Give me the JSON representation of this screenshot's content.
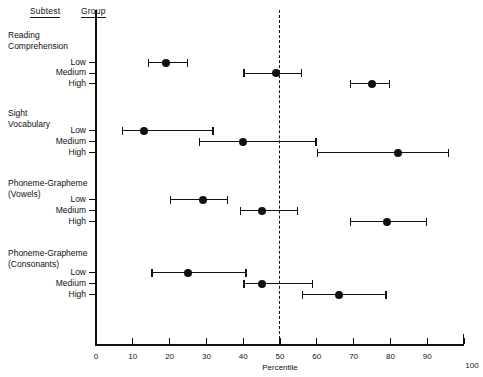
{
  "headers": {
    "subtest": "Subtest",
    "group": "Group"
  },
  "axis": {
    "xlabel": "Percentile",
    "ticks": [
      "0",
      "10",
      "20",
      "30",
      "40",
      "50",
      "60",
      "70",
      "80",
      "90",
      "100"
    ],
    "reference_value": 50
  },
  "chart_data": {
    "type": "scatter",
    "title": "",
    "subtitle": "",
    "xlabel": "Percentile",
    "ylabel": "",
    "xlim": [
      0,
      100
    ],
    "grid": false,
    "legend": "none",
    "reference_line": {
      "value": 50,
      "style": "dashed"
    },
    "annotations": [
      "Dashed vertical reference line at the 50th percentile"
    ],
    "tick_labels": [
      "0",
      "10",
      "20",
      "30",
      "40",
      "50",
      "60",
      "70",
      "80",
      "90",
      "100"
    ],
    "categories": [
      "Reading Comprehension - Low",
      "Reading Comprehension - Medium",
      "Reading Comprehension - High",
      "Sight Vocabulary - Low",
      "Sight Vocabulary - Medium",
      "Sight Vocabulary - High",
      "Phoneme-Grapheme (Vowels) - Low",
      "Phoneme-Grapheme (Vowels) - Medium",
      "Phoneme-Grapheme (Vowels) - High",
      "Phoneme-Grapheme (Consonants) - Low",
      "Phoneme-Grapheme (Consonants) - Medium",
      "Phoneme-Grapheme (Consonants) - High"
    ],
    "values": [
      19,
      49,
      75,
      13,
      40,
      82,
      29,
      45,
      79,
      25,
      45,
      66
    ],
    "ci_low": [
      14,
      40,
      69,
      7,
      28,
      60,
      20,
      39,
      69,
      15,
      40,
      56
    ],
    "ci_high": [
      25,
      56,
      80,
      32,
      60,
      96,
      36,
      55,
      90,
      41,
      59,
      79
    ],
    "subtests": [
      {
        "name": "Reading\nComprehension",
        "line1": "Reading",
        "line2": "Comprehension",
        "rows": [
          {
            "group": "Low",
            "value": 19,
            "low": 14,
            "high": 25
          },
          {
            "group": "Medium",
            "value": 49,
            "low": 40,
            "high": 56
          },
          {
            "group": "High",
            "value": 75,
            "low": 69,
            "high": 80
          }
        ]
      },
      {
        "name": "Sight\nVocabulary",
        "line1": "Sight",
        "line2": "Vocabulary",
        "rows": [
          {
            "group": "Low",
            "value": 13,
            "low": 7,
            "high": 32
          },
          {
            "group": "Medium",
            "value": 40,
            "low": 28,
            "high": 60
          },
          {
            "group": "High",
            "value": 82,
            "low": 60,
            "high": 96
          }
        ]
      },
      {
        "name": "Phoneme-Grapheme\n(Vowels)",
        "line1": "Phoneme-Grapheme",
        "line2": "(Vowels)",
        "rows": [
          {
            "group": "Low",
            "value": 29,
            "low": 20,
            "high": 36
          },
          {
            "group": "Medium",
            "value": 45,
            "low": 39,
            "high": 55
          },
          {
            "group": "High",
            "value": 79,
            "low": 69,
            "high": 90
          }
        ]
      },
      {
        "name": "Phoneme-Grapheme\n(Consonants)",
        "line1": "Phoneme-Grapheme",
        "line2": "(Consonants)",
        "rows": [
          {
            "group": "Low",
            "value": 25,
            "low": 15,
            "high": 41
          },
          {
            "group": "Medium",
            "value": 45,
            "low": 40,
            "high": 59
          },
          {
            "group": "High",
            "value": 66,
            "low": 56,
            "high": 79
          }
        ]
      }
    ]
  }
}
